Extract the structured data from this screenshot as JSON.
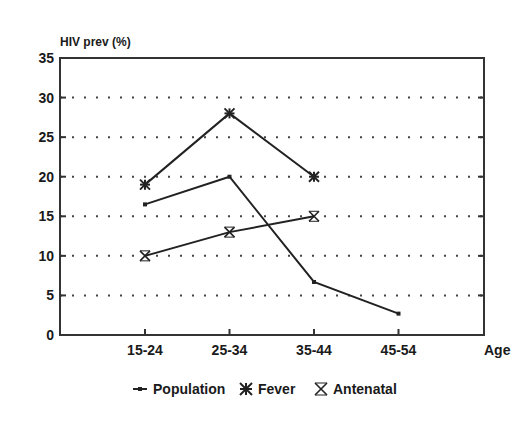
{
  "chart_data": {
    "type": "line",
    "title": "",
    "ylabel": "HIV prev (%)",
    "xlabel": "Age",
    "categories": [
      "15-24",
      "25-34",
      "35-44",
      "45-54"
    ],
    "ylim": [
      0,
      35
    ],
    "yticks": [
      0,
      5,
      10,
      15,
      20,
      25,
      30,
      35
    ],
    "grid": "horizontal dotted",
    "legend_position": "bottom",
    "series": [
      {
        "name": "Population",
        "marker": "small-square",
        "values": [
          16.5,
          20,
          6.7,
          2.7
        ]
      },
      {
        "name": "Fever",
        "marker": "asterisk",
        "values": [
          19,
          28,
          20,
          null
        ]
      },
      {
        "name": "Antenatal",
        "marker": "x-cross",
        "values": [
          10,
          13,
          15,
          null
        ]
      }
    ]
  },
  "colors": {
    "line": "#222222",
    "grid": "#555555",
    "axis": "#333333"
  }
}
